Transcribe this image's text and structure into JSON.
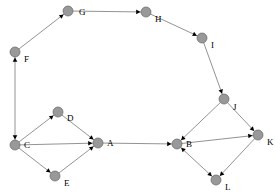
{
  "figure": {
    "type": "directed-graph",
    "width": 275,
    "height": 195,
    "background": "#ffffff",
    "node_fill": "#999999",
    "node_stroke": "#666666",
    "edge_color": "#777777",
    "arrow_color": "#000000",
    "label_color": "#000000",
    "node_radius": 5.0
  },
  "nodes": [
    {
      "id": "A",
      "label": "A",
      "x": 98,
      "y": 143,
      "label_dx": 9,
      "label_dy": -4
    },
    {
      "id": "B",
      "label": "B",
      "x": 177,
      "y": 144,
      "label_dx": 9,
      "label_dy": -4
    },
    {
      "id": "C",
      "label": "C",
      "x": 15,
      "y": 145,
      "label_dx": 9,
      "label_dy": -4
    },
    {
      "id": "D",
      "label": "D",
      "x": 58,
      "y": 112,
      "label_dx": 9,
      "label_dy": 2
    },
    {
      "id": "E",
      "label": "E",
      "x": 55,
      "y": 176,
      "label_dx": 9,
      "label_dy": 3
    },
    {
      "id": "F",
      "label": "F",
      "x": 15,
      "y": 52,
      "label_dx": 9,
      "label_dy": 3
    },
    {
      "id": "G",
      "label": "G",
      "x": 68,
      "y": 11,
      "label_dx": 11,
      "label_dy": -3
    },
    {
      "id": "H",
      "label": "H",
      "x": 146,
      "y": 12,
      "label_dx": 9,
      "label_dy": 3
    },
    {
      "id": "I",
      "label": "I",
      "x": 202,
      "y": 38,
      "label_dx": 9,
      "label_dy": 3
    },
    {
      "id": "J",
      "label": "J",
      "x": 224,
      "y": 99,
      "label_dx": 9,
      "label_dy": 4
    },
    {
      "id": "K",
      "label": "K",
      "x": 258,
      "y": 135,
      "label_dx": 9,
      "label_dy": 3
    },
    {
      "id": "L",
      "label": "L",
      "x": 216,
      "y": 180,
      "label_dx": 9,
      "label_dy": 3
    }
  ],
  "edges": [
    {
      "from": "C",
      "to": "F",
      "bidirectional": true
    },
    {
      "from": "F",
      "to": "G",
      "bidirectional": false
    },
    {
      "from": "G",
      "to": "H",
      "bidirectional": false
    },
    {
      "from": "H",
      "to": "I",
      "bidirectional": false
    },
    {
      "from": "I",
      "to": "J",
      "bidirectional": false
    },
    {
      "from": "J",
      "to": "B",
      "bidirectional": false
    },
    {
      "from": "J",
      "to": "K",
      "bidirectional": false
    },
    {
      "from": "B",
      "to": "K",
      "bidirectional": false
    },
    {
      "from": "B",
      "to": "L",
      "bidirectional": true
    },
    {
      "from": "K",
      "to": "L",
      "bidirectional": false
    },
    {
      "from": "A",
      "to": "B",
      "bidirectional": false
    },
    {
      "from": "C",
      "to": "A",
      "bidirectional": false
    },
    {
      "from": "C",
      "to": "D",
      "bidirectional": false
    },
    {
      "from": "D",
      "to": "A",
      "bidirectional": false
    },
    {
      "from": "C",
      "to": "E",
      "bidirectional": false
    },
    {
      "from": "E",
      "to": "A",
      "bidirectional": false
    }
  ],
  "chart_data": {
    "type": "graph",
    "title": "",
    "node_ids": [
      "A",
      "B",
      "C",
      "D",
      "E",
      "F",
      "G",
      "H",
      "I",
      "J",
      "K",
      "L"
    ],
    "edge_list": [
      [
        "C",
        "F"
      ],
      [
        "F",
        "C"
      ],
      [
        "F",
        "G"
      ],
      [
        "G",
        "H"
      ],
      [
        "H",
        "I"
      ],
      [
        "I",
        "J"
      ],
      [
        "J",
        "B"
      ],
      [
        "J",
        "K"
      ],
      [
        "B",
        "K"
      ],
      [
        "B",
        "L"
      ],
      [
        "L",
        "B"
      ],
      [
        "K",
        "L"
      ],
      [
        "A",
        "B"
      ],
      [
        "C",
        "A"
      ],
      [
        "C",
        "D"
      ],
      [
        "D",
        "A"
      ],
      [
        "C",
        "E"
      ],
      [
        "E",
        "A"
      ]
    ]
  }
}
